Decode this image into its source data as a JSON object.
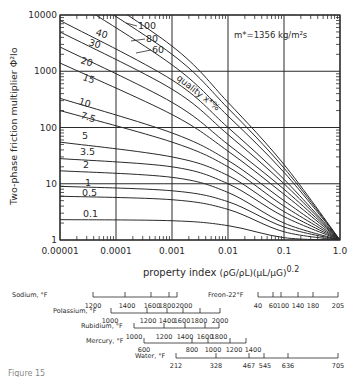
{
  "chart_data": {
    "type": "line",
    "title": "",
    "annotation": "m*=1356 kg/m²s",
    "xlabel": "property index",
    "xlabel_formula": "(ρG/ρL)(μL/μG)^0.2",
    "ylabel": "Two-phase friction multiplier Φ²lo",
    "xscale": "log",
    "yscale": "log",
    "xlim": [
      1e-05,
      1.0
    ],
    "ylim": [
      1,
      10000
    ],
    "x_ticks": [
      "0.00001",
      "0.0001",
      "0.001",
      "0.01",
      "0.1",
      "1.0"
    ],
    "y_ticks": [
      "1",
      "10",
      "100",
      "1000",
      "10000"
    ],
    "grid": true,
    "legend_title": "quality x*%",
    "series": [
      {
        "name": "0.1",
        "points": [
          [
            1e-05,
            2.3
          ],
          [
            0.001,
            2.2
          ],
          [
            0.01,
            1.8
          ],
          [
            0.1,
            1.1
          ],
          [
            1.0,
            1
          ]
        ]
      },
      {
        "name": "0.5",
        "points": [
          [
            1e-05,
            6
          ],
          [
            0.001,
            5.2
          ],
          [
            0.01,
            3.5
          ],
          [
            0.1,
            1.4
          ],
          [
            1.0,
            1
          ]
        ]
      },
      {
        "name": "1",
        "points": [
          [
            1e-05,
            9
          ],
          [
            0.001,
            7.5
          ],
          [
            0.01,
            4.8
          ],
          [
            0.1,
            1.7
          ],
          [
            1.0,
            1
          ]
        ]
      },
      {
        "name": "2",
        "points": [
          [
            1e-05,
            17
          ],
          [
            0.001,
            13
          ],
          [
            0.01,
            7
          ],
          [
            0.1,
            2
          ],
          [
            1.0,
            1
          ]
        ]
      },
      {
        "name": "3.5",
        "points": [
          [
            1e-05,
            28
          ],
          [
            0.001,
            20
          ],
          [
            0.01,
            10
          ],
          [
            0.1,
            2.6
          ],
          [
            1.0,
            1
          ]
        ]
      },
      {
        "name": "5",
        "points": [
          [
            1e-05,
            55
          ],
          [
            0.001,
            30
          ],
          [
            0.01,
            14
          ],
          [
            0.1,
            3.2
          ],
          [
            1.0,
            1
          ]
        ]
      },
      {
        "name": "7.5",
        "points": [
          [
            1e-05,
            200
          ],
          [
            0.001,
            55
          ],
          [
            0.01,
            20
          ],
          [
            0.1,
            4
          ],
          [
            1.0,
            1
          ]
        ]
      },
      {
        "name": "10",
        "points": [
          [
            1e-05,
            330
          ],
          [
            0.001,
            80
          ],
          [
            0.01,
            26
          ],
          [
            0.1,
            5
          ],
          [
            1.0,
            1
          ]
        ]
      },
      {
        "name": "15",
        "points": [
          [
            1e-05,
            1400
          ],
          [
            0.001,
            170
          ],
          [
            0.01,
            38
          ],
          [
            0.1,
            6.5
          ],
          [
            1.0,
            1
          ]
        ]
      },
      {
        "name": "20",
        "points": [
          [
            1e-05,
            2700
          ],
          [
            0.001,
            280
          ],
          [
            0.01,
            50
          ],
          [
            0.1,
            8
          ],
          [
            1.0,
            1
          ]
        ]
      },
      {
        "name": "30",
        "points": [
          [
            1e-05,
            5000
          ],
          [
            0.001,
            480
          ],
          [
            0.01,
            75
          ],
          [
            0.1,
            10
          ],
          [
            1.0,
            1
          ]
        ]
      },
      {
        "name": "40",
        "points": [
          [
            1e-05,
            8000
          ],
          [
            0.001,
            700
          ],
          [
            0.01,
            100
          ],
          [
            0.1,
            12
          ],
          [
            1.0,
            1
          ]
        ]
      },
      {
        "name": "60",
        "points": [
          [
            1e-05,
            25000
          ],
          [
            0.001,
            1300
          ],
          [
            0.01,
            160
          ],
          [
            0.1,
            16
          ],
          [
            1.0,
            1
          ]
        ]
      },
      {
        "name": "80",
        "points": [
          [
            1e-05,
            40000
          ],
          [
            0.001,
            2000
          ],
          [
            0.01,
            220
          ],
          [
            0.1,
            19
          ],
          [
            1.0,
            1
          ]
        ]
      },
      {
        "name": "100",
        "points": [
          [
            1e-05,
            60000
          ],
          [
            0.001,
            2800
          ],
          [
            0.01,
            280
          ],
          [
            0.1,
            22
          ],
          [
            1.0,
            1
          ]
        ]
      }
    ],
    "temperature_scales": [
      {
        "name": "Sodium, °F",
        "ticks": [
          "1200",
          "1400",
          "1600",
          "1800",
          "2000"
        ]
      },
      {
        "name": "Polassium, °F",
        "ticks": [
          "1000",
          "1200",
          "1400",
          "1600",
          "1800",
          "2000"
        ]
      },
      {
        "name": "Rubidium, °F",
        "ticks": [
          "1000",
          "1200",
          "1400",
          "1600",
          "1800"
        ]
      },
      {
        "name": "Mercury, °F",
        "ticks": [
          "600",
          "800",
          "1000",
          "1200",
          "1400"
        ]
      },
      {
        "name": "Water, °F",
        "ticks": [
          "212",
          "328",
          "467",
          "545",
          "636",
          "705"
        ]
      },
      {
        "name": "Freon-22°F",
        "ticks": [
          "40",
          "60",
          "100",
          "140",
          "180",
          "205"
        ]
      }
    ]
  },
  "labels": {
    "annotation": "m*=1356 kg/m²s",
    "quality": "quality x*%",
    "xlabel": "property index",
    "xformula": "(ρG/ρL)(μL/μG)",
    "xexp": "0.2",
    "ylabel": "Two-phase friction multiplier Φ²lo",
    "caption": "Figure 15"
  }
}
